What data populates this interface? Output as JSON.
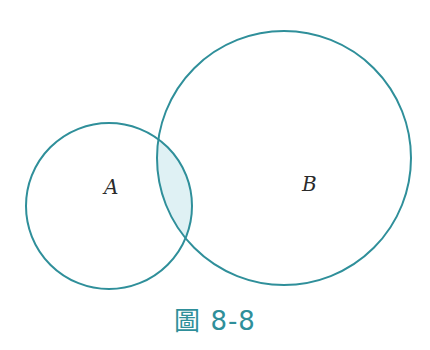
{
  "diagram": {
    "type": "venn",
    "sets": [
      {
        "label": "A",
        "cx": 109,
        "cy": 206,
        "r": 83
      },
      {
        "label": "B",
        "cx": 284,
        "cy": 158,
        "r": 127
      }
    ],
    "intersection_shaded": true,
    "colors": {
      "stroke": "#2f8f9a",
      "fill": "#dff1f4"
    }
  },
  "labels": {
    "a": "A",
    "b": "B"
  },
  "caption": "圖 8-8"
}
